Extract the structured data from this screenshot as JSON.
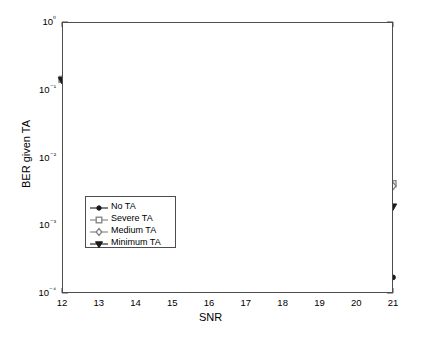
{
  "chart_data": {
    "type": "line",
    "title": "",
    "xlabel": "SNR",
    "ylabel": "BER given TA",
    "xlim": [
      12,
      21
    ],
    "ylim": [
      0.0001,
      1
    ],
    "yscale": "log",
    "grid": false,
    "legend_position": "lower-left-inside",
    "xticks": [
      "12",
      "13",
      "14",
      "15",
      "16",
      "17",
      "18",
      "19",
      "20",
      "21"
    ],
    "yticks": [
      "10⁰",
      "10⁻¹",
      "10⁻²",
      "10⁻³",
      "10⁻⁴"
    ],
    "x": [
      12,
      13,
      14,
      15,
      16,
      17,
      18,
      19,
      20,
      21
    ],
    "series": [
      {
        "name": "No TA",
        "marker": "circle",
        "color": "#1a1a1a",
        "values": [
          0.14,
          0.1,
          0.073,
          0.044,
          0.024,
          0.0115,
          0.0052,
          0.0015,
          0.00055,
          0.00017
        ]
      },
      {
        "name": "Severe TA",
        "marker": "square",
        "color": "#808080",
        "values": [
          0.142,
          0.105,
          0.078,
          0.054,
          0.032,
          0.021,
          0.0125,
          0.0075,
          0.0053,
          0.0041
        ]
      },
      {
        "name": "Medium TA",
        "marker": "diamond",
        "color": "#808080",
        "values": [
          0.141,
          0.104,
          0.077,
          0.052,
          0.031,
          0.0205,
          0.0121,
          0.0071,
          0.0049,
          0.0038
        ]
      },
      {
        "name": "Minimum TA",
        "marker": "triangle-down",
        "color": "#1a1a1a",
        "values": [
          0.14,
          0.102,
          0.075,
          0.047,
          0.0265,
          0.0152,
          0.0082,
          0.0045,
          0.0029,
          0.0019
        ]
      }
    ]
  },
  "legend": {
    "items": [
      {
        "label": "No TA"
      },
      {
        "label": "Severe TA"
      },
      {
        "label": "Medium TA"
      },
      {
        "label": "Minimum TA"
      }
    ]
  },
  "axes": {
    "x_title": "SNR",
    "y_title": "BER given TA"
  }
}
